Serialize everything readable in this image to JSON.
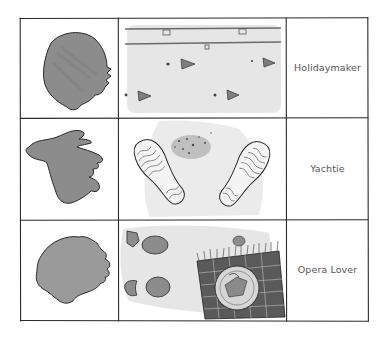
{
  "table": {
    "rows": [
      {
        "label": "Holidaymaker",
        "head_icon": "head-silhouette-round-icon",
        "scene": "beach-towels-with-flip-flops-scene"
      },
      {
        "label": "Yachtie",
        "head_icon": "head-silhouette-windswept-icon",
        "scene": "boat-shoe-soles-on-deck-scene"
      },
      {
        "label": "Opera Lover",
        "head_icon": "head-silhouette-curly-icon",
        "scene": "footprints-and-picnic-rug-with-plate-scene"
      }
    ]
  },
  "colors": {
    "ink": "#2a2a2a",
    "wash_dark": "#8a8a8a",
    "wash_mid": "#a8a8a8",
    "wash_light": "#e4e4e4",
    "text": "#555555",
    "background": "#ffffff"
  }
}
